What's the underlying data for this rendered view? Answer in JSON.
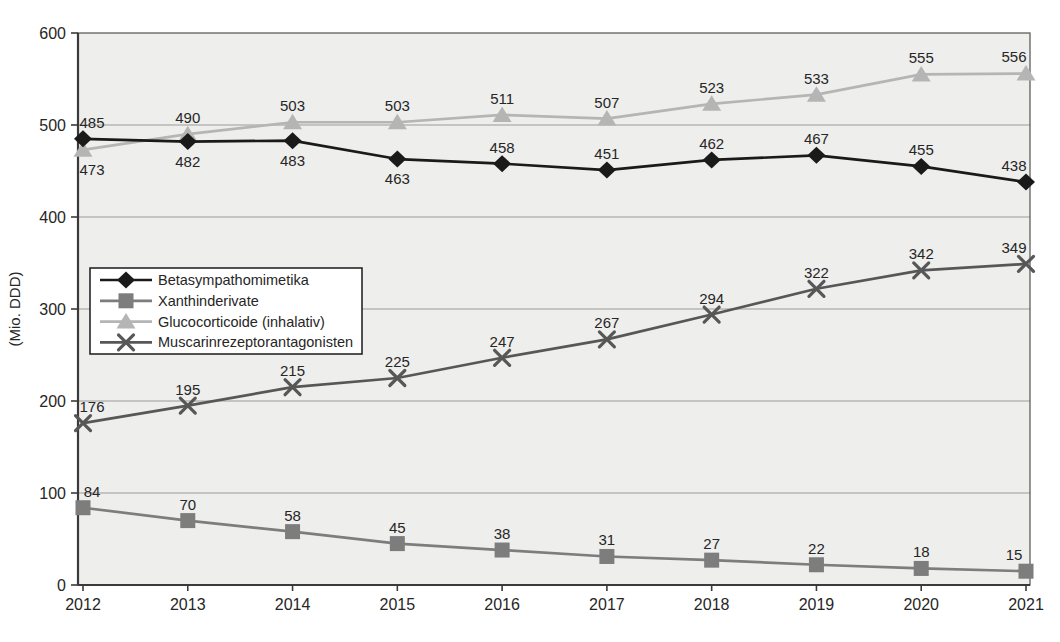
{
  "chart_data": {
    "type": "line",
    "title": "",
    "ylabel": "(Mio. DDD)",
    "x": [
      "2012",
      "2013",
      "2014",
      "2015",
      "2016",
      "2017",
      "2018",
      "2019",
      "2020",
      "2021"
    ],
    "ylim": [
      0,
      600
    ],
    "yticks": [
      0,
      100,
      200,
      300,
      400,
      500,
      600
    ],
    "grid": true,
    "legend_position": "middle-left",
    "series": [
      {
        "name": "Betasympathomimetika",
        "marker": "diamond",
        "color": "#1a1a1a",
        "values": [
          485,
          482,
          483,
          463,
          458,
          451,
          462,
          467,
          455,
          438
        ],
        "label_pos": [
          "above",
          "below",
          "below",
          "below",
          "above",
          "above",
          "above",
          "above",
          "above",
          "above"
        ]
      },
      {
        "name": "Xanthinderivate",
        "marker": "square",
        "color": "#7d7d7d",
        "values": [
          84,
          70,
          58,
          45,
          38,
          31,
          27,
          22,
          18,
          15
        ],
        "label_pos": [
          "above",
          "above",
          "above",
          "above",
          "above",
          "above",
          "above",
          "above",
          "above",
          "above"
        ]
      },
      {
        "name": "Glucocorticoide (inhalativ)",
        "marker": "triangle",
        "color": "#b5b5b5",
        "values": [
          473,
          490,
          503,
          503,
          511,
          507,
          523,
          533,
          555,
          556
        ],
        "label_pos": [
          "below",
          "above",
          "above",
          "above",
          "above",
          "above",
          "above",
          "above",
          "above",
          "above"
        ]
      },
      {
        "name": "Muscarinrezeptorantagonisten",
        "marker": "x",
        "color": "#575757",
        "values": [
          176,
          195,
          215,
          225,
          247,
          267,
          294,
          322,
          342,
          349
        ],
        "label_pos": [
          "above",
          "above",
          "above",
          "above",
          "above",
          "above",
          "above",
          "above",
          "above",
          "above"
        ]
      }
    ]
  },
  "colors": {
    "page_bg": "#ffffff",
    "plot_bg": "#eeeeec",
    "grid": "#9a9a9a",
    "axis": "#3a3a3a",
    "border": "#5f5f5f",
    "text": "#262626",
    "legend_bg": "#ffffff",
    "legend_border": "#1a1a1a"
  }
}
